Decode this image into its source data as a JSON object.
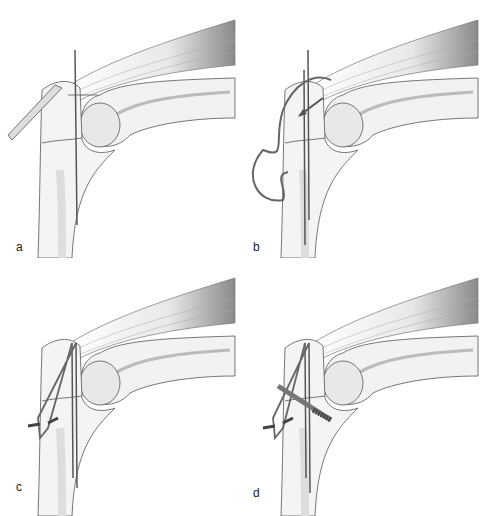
{
  "figure": {
    "panels": [
      {
        "id": "a",
        "label": "a",
        "step": "K-wire placement with drill guide"
      },
      {
        "id": "b",
        "label": "b",
        "step": "Wire passage through drill hole"
      },
      {
        "id": "c",
        "label": "c",
        "step": "Figure-of-eight tension band tightened"
      },
      {
        "id": "d",
        "label": "d",
        "step": "Tension band with additional screw"
      }
    ]
  },
  "colors": {
    "bone_fill": "#f0f0f0",
    "bone_shade": "#dcdcdc",
    "outline": "#555555",
    "wire": "#666666",
    "muscle": "#9a9a9a",
    "background": "#ffffff"
  }
}
